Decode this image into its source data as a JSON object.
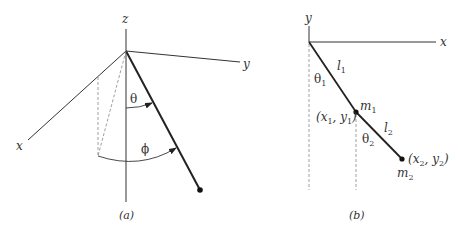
{
  "panel_a": {
    "caption": "(a)",
    "axes": {
      "z": "z",
      "y": "y",
      "x": "x"
    },
    "angles": {
      "polar": "θ",
      "azimuthal": "ϕ"
    },
    "description": "Spherical pendulum in 3D axes"
  },
  "panel_b": {
    "caption": "(b)",
    "axes": {
      "y": "y",
      "x": "x"
    },
    "lengths": {
      "l1": "l",
      "l1_sub": "1",
      "l2": "l",
      "l2_sub": "2"
    },
    "angles": {
      "theta1": "θ",
      "theta1_sub": "1",
      "theta2": "θ",
      "theta2_sub": "2"
    },
    "masses": {
      "m1": "m",
      "m1_sub": "1",
      "m2": "m",
      "m2_sub": "2"
    },
    "coords": {
      "p1_open": "(x",
      "p1_sub_x": "1",
      "p1_mid": ", y",
      "p1_sub_y": "1",
      "p1_close": ")",
      "p2_open": "(x",
      "p2_sub_x": "2",
      "p2_mid": ", y",
      "p2_sub_y": "2",
      "p2_close": ")"
    },
    "description": "Double pendulum in 2D plane"
  },
  "colors": {
    "line": "#222222",
    "dashed": "#777777",
    "text": "#333333"
  }
}
